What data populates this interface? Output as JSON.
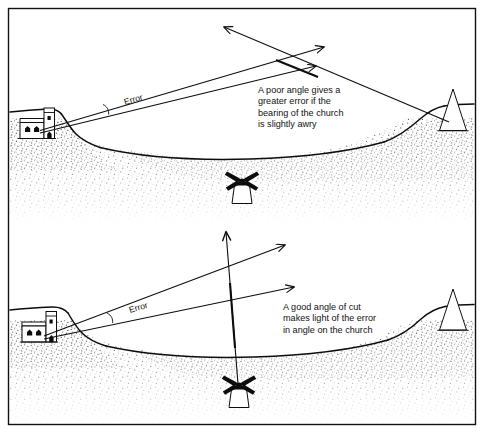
{
  "figure": {
    "background_color": "#ffffff",
    "ink_color": "#0d0d0d",
    "frame": {
      "name": "outer-border",
      "color": "#111111"
    }
  },
  "panels": [
    {
      "id": "poor-angle",
      "name": "top-panel",
      "caption_lines": [
        "A poor angle gives a",
        "greater error if the",
        "bearing of the church",
        "is slightly awry"
      ],
      "error_label": "Error",
      "landmarks": [
        {
          "name": "church",
          "label": "church"
        },
        {
          "name": "beacon",
          "label": "beacon"
        },
        {
          "name": "windmill",
          "label": "windmill"
        }
      ],
      "angle_quality": "poor"
    },
    {
      "id": "good-angle",
      "name": "bottom-panel",
      "caption_lines": [
        "A good angle of cut",
        "makes light of the error",
        "in angle on the church"
      ],
      "error_label": "Error",
      "landmarks": [
        {
          "name": "church",
          "label": "church"
        },
        {
          "name": "beacon",
          "label": "beacon"
        },
        {
          "name": "windmill",
          "label": "windmill"
        }
      ],
      "angle_quality": "good"
    }
  ]
}
